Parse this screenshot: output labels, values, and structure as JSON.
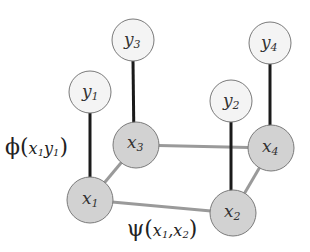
{
  "diagram": {
    "type": "pairwise-markov-random-field",
    "colors": {
      "hidden_fill": "#d2d2d2",
      "observed_fill": "#f4f4f4",
      "node_stroke": "#7a7a7a",
      "observation_edge": "#1a1a1a",
      "pairwise_edge": "#9a9a9a"
    },
    "nodes": {
      "y1": {
        "base": "y",
        "sub": "1"
      },
      "y2": {
        "base": "y",
        "sub": "2"
      },
      "y3": {
        "base": "y",
        "sub": "3"
      },
      "y4": {
        "base": "y",
        "sub": "4"
      },
      "x1": {
        "base": "x",
        "sub": "1"
      },
      "x2": {
        "base": "x",
        "sub": "2"
      },
      "x3": {
        "base": "x",
        "sub": "3"
      },
      "x4": {
        "base": "x",
        "sub": "4"
      }
    },
    "edges": {
      "observation": [
        [
          "x1",
          "y1"
        ],
        [
          "x2",
          "y2"
        ],
        [
          "x3",
          "y3"
        ],
        [
          "x4",
          "y4"
        ]
      ],
      "pairwise": [
        [
          "x1",
          "x2"
        ],
        [
          "x1",
          "x3"
        ],
        [
          "x3",
          "x4"
        ],
        [
          "x2",
          "x4"
        ]
      ]
    },
    "labels": {
      "phi": {
        "symbol": "ϕ",
        "open": "(",
        "arg1": "x",
        "arg1_sub": "1",
        "arg2": "y",
        "arg2_sub": "1",
        "close": ")"
      },
      "psi": {
        "symbol": "ψ",
        "open": "(",
        "arg1": "x",
        "arg1_sub": "1",
        "sep": ",",
        "arg2": "x",
        "arg2_sub": "2",
        "close": ")"
      }
    }
  }
}
